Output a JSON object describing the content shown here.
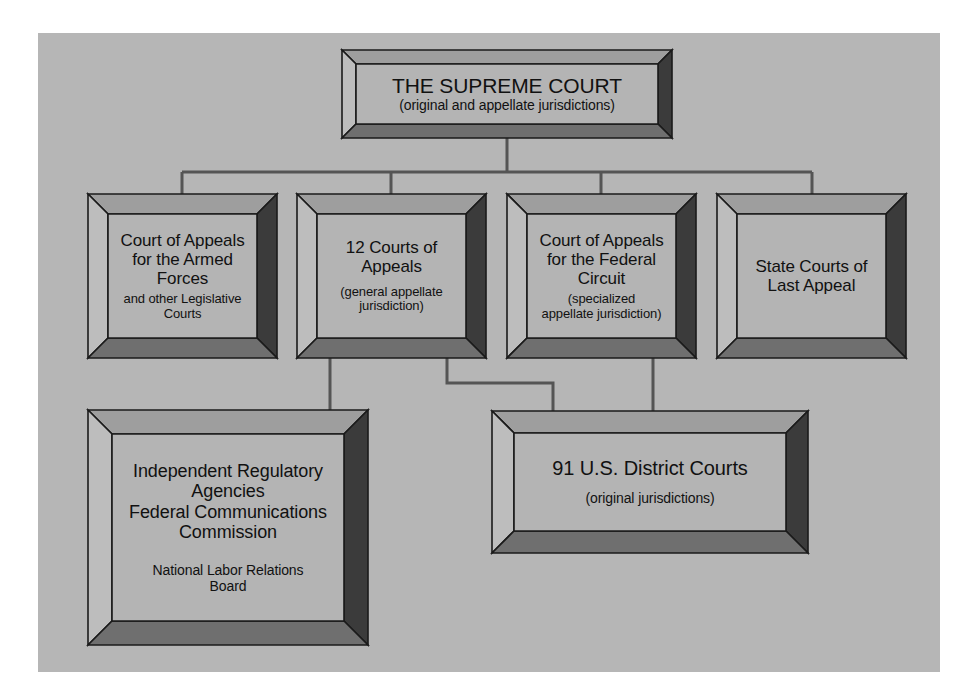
{
  "diagram": {
    "background_color": "#b6b6b6",
    "box_face_color": "#b4b4b4",
    "bevel_light_color": "#9e9e9e",
    "bevel_dark_color": "#3b3b3b",
    "connector_color": "#555555",
    "text_color": "#111111",
    "nodes": [
      {
        "id": "supreme-court",
        "main": "THE SUPREME COURT",
        "sub": "(original and appellate jurisdictions)",
        "x": 342,
        "y": 50,
        "w": 330,
        "h": 88,
        "bevel": 14
      },
      {
        "id": "court-appeals-armed-forces",
        "main": "Court of  Appeals\nfor the Armed\nForces",
        "sub": "and other Legislative\nCourts",
        "x": 88,
        "y": 194,
        "w": 189,
        "h": 164,
        "bevel": 20
      },
      {
        "id": "twelve-courts-of-appeals",
        "main": "12 Courts of\nAppeals",
        "sub": "(general appellate\njurisdiction)",
        "x": 297,
        "y": 194,
        "w": 189,
        "h": 164,
        "bevel": 20
      },
      {
        "id": "court-appeals-federal-circuit",
        "main": "Court of Appeals\nfor the Federal\nCircuit",
        "sub": "(specialized\nappellate jurisdiction)",
        "x": 507,
        "y": 194,
        "w": 189,
        "h": 164,
        "bevel": 20
      },
      {
        "id": "state-courts-last-appeal",
        "main": "State Courts of\nLast Appeal",
        "sub": "",
        "x": 717,
        "y": 194,
        "w": 189,
        "h": 164,
        "bevel": 20
      },
      {
        "id": "independent-regulatory-agencies",
        "main": "Independent Regulatory\nAgencies\nFederal Communications\nCommission",
        "sub": "National Labor Relations\nBoard",
        "x": 88,
        "y": 410,
        "w": 280,
        "h": 235,
        "bevel": 24
      },
      {
        "id": "us-district-courts",
        "main": "91 U.S. District Courts",
        "sub": "(original jurisdictions)",
        "x": 492,
        "y": 411,
        "w": 316,
        "h": 142,
        "bevel": 22
      }
    ],
    "connectors": [
      {
        "id": "supreme-to-bus",
        "path": "M 507 138 L 507 172"
      },
      {
        "id": "bus-horizontal",
        "path": "M 182 172 L 812 172"
      },
      {
        "id": "bus-to-armed-forces",
        "path": "M 182 172 L 182 194"
      },
      {
        "id": "bus-to-12-courts",
        "path": "M 391 172 L 391 194"
      },
      {
        "id": "bus-to-federal-circuit",
        "path": "M 601 172 L 601 194"
      },
      {
        "id": "bus-to-state-courts",
        "path": "M 812 172 L 812 194"
      },
      {
        "id": "12-courts-to-agencies",
        "path": "M 330 358 L 330 410"
      },
      {
        "id": "12-courts-to-district",
        "path": "M 447 358 L 447 383 L 553 383 L 553 411"
      },
      {
        "id": "federal-circuit-to-district",
        "path": "M 653 358 L 653 411"
      }
    ]
  }
}
